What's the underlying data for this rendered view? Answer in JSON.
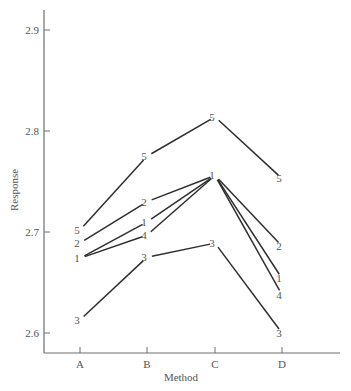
{
  "chart_data": {
    "type": "line",
    "title": "",
    "xlabel": "Method",
    "ylabel": "Response",
    "categories": [
      "A",
      "B",
      "C",
      "D"
    ],
    "yticks": [
      2.6,
      2.7,
      2.8,
      2.9
    ],
    "ytick_labels": [
      "2.6",
      "2.7",
      "2.8",
      "2.9"
    ],
    "ylim": [
      2.58,
      2.92
    ],
    "grid": false,
    "legend": "none (series labeled inline at each point)",
    "series": [
      {
        "name": "1",
        "values": [
          2.674,
          2.71,
          2.756,
          2.654
        ]
      },
      {
        "name": "2",
        "values": [
          2.689,
          2.73,
          2.756,
          2.686
        ]
      },
      {
        "name": "3",
        "values": [
          2.613,
          2.675,
          2.689,
          2.6
        ]
      },
      {
        "name": "4",
        "values": [
          2.674,
          2.697,
          2.756,
          2.638
        ]
      },
      {
        "name": "5",
        "values": [
          2.702,
          2.775,
          2.814,
          2.753
        ]
      }
    ],
    "point_labels": [
      {
        "category": "A",
        "labels": [
          "5",
          "2",
          "1",
          "3"
        ]
      },
      {
        "category": "B",
        "labels": [
          "5",
          "2",
          "1",
          "4",
          "3"
        ]
      },
      {
        "category": "C",
        "labels": [
          "5",
          "1",
          "3"
        ]
      },
      {
        "category": "D",
        "labels": [
          "5",
          "2",
          "1",
          "4",
          "3"
        ]
      }
    ]
  },
  "layout": {
    "x_axis_y": 353,
    "y_axis_x": 44,
    "y_axis_top": 10,
    "x_axis_right": 340,
    "category_x": [
      80,
      147,
      215,
      282
    ],
    "y_at_2_6": 333,
    "px_per_unit": 1010
  }
}
